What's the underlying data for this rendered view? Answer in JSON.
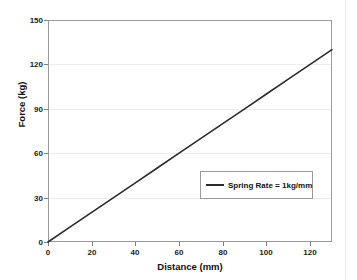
{
  "chart_data": {
    "type": "line",
    "title": "",
    "xlabel": "Distance (mm)",
    "ylabel": "Force (kg)",
    "xlim": [
      0,
      130
    ],
    "ylim": [
      0,
      150
    ],
    "grid": "horizontal",
    "legend_position": "inside-lower-right",
    "x_ticks": [
      {
        "value": 0,
        "label": "0"
      },
      {
        "value": 20,
        "label": "20"
      },
      {
        "value": 40,
        "label": "40"
      },
      {
        "value": 60,
        "label": "60"
      },
      {
        "value": 80,
        "label": "80"
      },
      {
        "value": 100,
        "label": "100"
      },
      {
        "value": 120,
        "label": "120"
      }
    ],
    "y_ticks": [
      {
        "value": 0,
        "label": "0"
      },
      {
        "value": 30,
        "label": "30"
      },
      {
        "value": 60,
        "label": "60"
      },
      {
        "value": 90,
        "label": "90"
      },
      {
        "value": 120,
        "label": "120"
      },
      {
        "value": 150,
        "label": "150"
      }
    ],
    "series": [
      {
        "name": "Spring Rate = 1kg/mm",
        "color": "#2b2b2b",
        "x": [
          0,
          10,
          20,
          30,
          40,
          50,
          60,
          70,
          80,
          90,
          100,
          110,
          120,
          130
        ],
        "values": [
          0,
          10,
          20,
          30,
          40,
          50,
          60,
          70,
          80,
          90,
          100,
          110,
          120,
          130
        ]
      }
    ],
    "legend": [
      {
        "label": "Spring Rate = 1kg/mm",
        "color": "#2b2b2b"
      }
    ]
  }
}
